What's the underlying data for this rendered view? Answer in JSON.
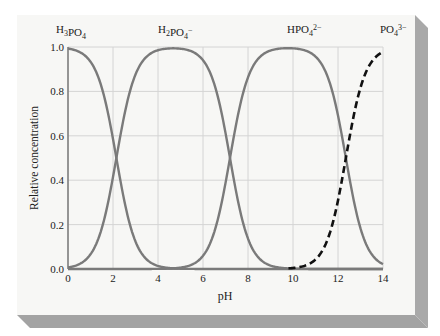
{
  "chart_data": {
    "type": "line",
    "title": "",
    "xlabel": "pH",
    "ylabel": "Relative concentration",
    "xlim": [
      0,
      14
    ],
    "ylim": [
      0.0,
      1.0
    ],
    "xticks": [
      "0",
      "2",
      "4",
      "6",
      "8",
      "10",
      "12",
      "14"
    ],
    "yticks": [
      "0.0",
      "0.2",
      "0.4",
      "0.6",
      "0.8",
      "1.0"
    ],
    "grid": true,
    "legend": "inline labels above curves",
    "pKa": [
      2.15,
      7.2,
      12.35
    ],
    "series": [
      {
        "name": "H3PO4",
        "label_base": "H",
        "label_sub1": "3",
        "label_mid": "PO",
        "label_sub2": "4",
        "label_sup": "",
        "style": "solid",
        "color": "#7a7a7a",
        "x": [
          0,
          1,
          2,
          2.15,
          3,
          4,
          5,
          6,
          14
        ],
        "values": [
          0.99,
          0.93,
          0.59,
          0.5,
          0.12,
          0.01,
          0.0,
          0.0,
          0.0
        ]
      },
      {
        "name": "H2PO4-",
        "label_base": "H",
        "label_sub1": "2",
        "label_mid": "PO",
        "label_sub2": "4",
        "label_sup": "−",
        "style": "solid",
        "color": "#7a7a7a",
        "x": [
          0,
          1,
          2,
          2.15,
          3,
          4,
          4.7,
          6,
          7,
          7.2,
          8,
          9,
          10,
          14
        ],
        "values": [
          0.01,
          0.07,
          0.41,
          0.5,
          0.88,
          0.98,
          0.99,
          0.94,
          0.61,
          0.5,
          0.14,
          0.02,
          0.0,
          0.0
        ]
      },
      {
        "name": "HPO4 2-",
        "label_base": "HPO",
        "label_sub1": "4",
        "label_mid": "",
        "label_sub2": "",
        "label_sup": "2−",
        "style": "solid",
        "color": "#7a7a7a",
        "x": [
          0,
          5,
          6,
          7,
          7.2,
          8,
          9,
          9.8,
          11,
          12,
          12.35,
          13,
          14
        ],
        "values": [
          0.0,
          0.01,
          0.06,
          0.39,
          0.5,
          0.86,
          0.98,
          0.99,
          0.96,
          0.69,
          0.5,
          0.18,
          0.02
        ]
      },
      {
        "name": "PO4 3-",
        "label_base": "PO",
        "label_sub1": "4",
        "label_mid": "",
        "label_sub2": "",
        "label_sup": "3−",
        "style": "dashed",
        "color": "#111111",
        "x": [
          9.8,
          10,
          11,
          12,
          12.35,
          13,
          14
        ],
        "values": [
          0.0,
          0.0,
          0.04,
          0.31,
          0.5,
          0.82,
          0.98
        ]
      }
    ]
  },
  "colors": {
    "card_face": "#f7f7f5",
    "card_shadow": "#a9a9a9",
    "grid": "#d4d4d4",
    "axis": "#7a7a7a",
    "curve": "#7a7a7a",
    "dashed": "#111111"
  }
}
